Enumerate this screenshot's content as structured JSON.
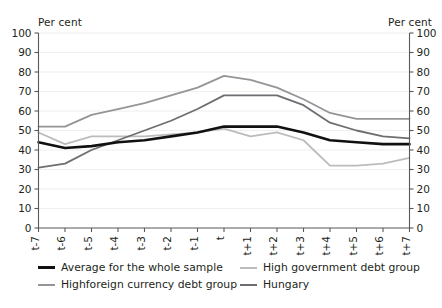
{
  "chart_data": {
    "type": "line",
    "title": "",
    "xlabel": "",
    "ylabel": "Per cent",
    "ylabel_right": "Per cent",
    "ylim": [
      0,
      100
    ],
    "ytick_step": 10,
    "grid": true,
    "legend_position": "bottom",
    "categories": [
      "t-7",
      "t-6",
      "t-5",
      "t-4",
      "t-3",
      "t-2",
      "t-1",
      "t",
      "t+1",
      "t+2",
      "t+3",
      "t+4",
      "t+5",
      "t+6",
      "t+7"
    ],
    "yticks": [
      0,
      10,
      20,
      30,
      40,
      50,
      60,
      70,
      80,
      90,
      100
    ],
    "series": [
      {
        "name": "Average for the whole sample",
        "color": "#111111",
        "width": 2.6,
        "values": [
          44,
          41,
          42,
          44,
          45,
          47,
          49,
          52,
          52,
          52,
          49,
          45,
          44,
          43,
          43
        ]
      },
      {
        "name": "High government debt group",
        "color": "#bcbcbc",
        "width": 1.8,
        "values": [
          49,
          43,
          47,
          47,
          47,
          48,
          49,
          51,
          47,
          49,
          45,
          32,
          32,
          33,
          36
        ]
      },
      {
        "name": "Highforeign currency debt group",
        "color": "#939598",
        "width": 1.8,
        "values": [
          52,
          52,
          58,
          61,
          64,
          68,
          72,
          78,
          76,
          72,
          66,
          59,
          56,
          56,
          56
        ]
      },
      {
        "name": "Hungary",
        "color": "#6d6e71",
        "width": 1.8,
        "values": [
          31,
          33,
          40,
          45,
          50,
          55,
          61,
          68,
          68,
          68,
          63,
          54,
          50,
          47,
          46
        ]
      }
    ]
  },
  "axes": {
    "left_unit": "Per cent",
    "right_unit": "Per cent"
  },
  "legend": {
    "entries": [
      {
        "label": "Average for the whole sample",
        "color": "#111111",
        "thickness": 3
      },
      {
        "label": "High government debt group",
        "color": "#bcbcbc",
        "thickness": 2
      },
      {
        "label": "Highforeign currency debt group",
        "color": "#939598",
        "thickness": 2
      },
      {
        "label": "Hungary",
        "color": "#6d6e71",
        "thickness": 2
      }
    ]
  }
}
